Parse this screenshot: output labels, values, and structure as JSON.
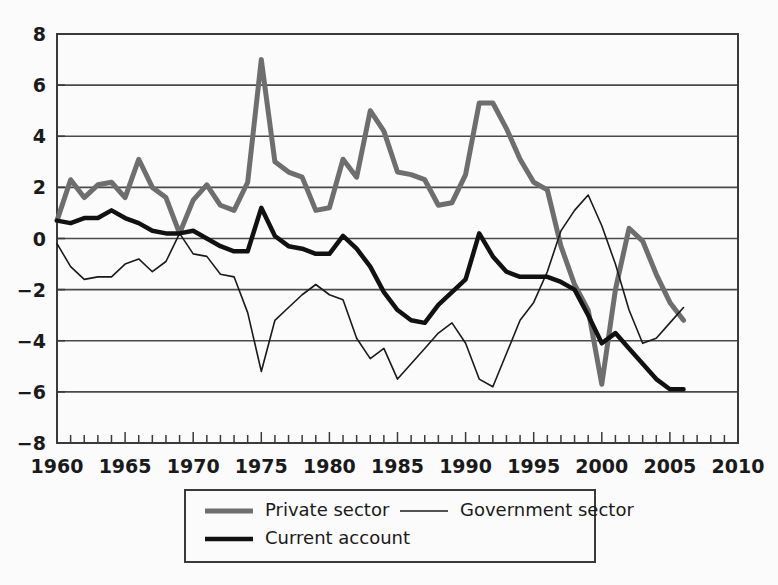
{
  "chart_data": {
    "type": "line",
    "title": "",
    "subtitle": "",
    "xlabel": "",
    "ylabel": "",
    "xlim": [
      1960,
      2010
    ],
    "ylim": [
      -8,
      8
    ],
    "grid": true,
    "grid_axis": "y",
    "legend_position": "bottom",
    "x_tick_labels": [
      "1960",
      "1965",
      "1970",
      "1975",
      "1980",
      "1985",
      "1990",
      "1995",
      "2000",
      "2005",
      "2010"
    ],
    "x_tick_values": [
      1960,
      1965,
      1970,
      1975,
      1980,
      1985,
      1990,
      1995,
      2000,
      2005,
      2010
    ],
    "x_minor_tick_step": 1,
    "y_tick_labels": [
      "8",
      "6",
      "4",
      "2",
      "0",
      "−2",
      "−4",
      "−6",
      "−8"
    ],
    "y_tick_values": [
      8,
      6,
      4,
      2,
      0,
      -2,
      -4,
      -6,
      -8
    ],
    "x": [
      1960,
      1961,
      1962,
      1963,
      1964,
      1965,
      1966,
      1967,
      1968,
      1969,
      1970,
      1971,
      1972,
      1973,
      1974,
      1975,
      1976,
      1977,
      1978,
      1979,
      1980,
      1981,
      1982,
      1983,
      1984,
      1985,
      1986,
      1987,
      1988,
      1989,
      1990,
      1991,
      1992,
      1993,
      1994,
      1995,
      1996,
      1997,
      1998,
      1999,
      2000,
      2001,
      2002,
      2003,
      2004,
      2005,
      2006
    ],
    "series": [
      {
        "name": "Private sector",
        "color": "#6e6e6e",
        "width": 5,
        "values": [
          0.7,
          2.3,
          1.6,
          2.1,
          2.2,
          1.6,
          3.1,
          2.0,
          1.6,
          0.2,
          1.5,
          2.1,
          1.3,
          1.1,
          2.2,
          7.0,
          3.0,
          2.6,
          2.4,
          1.1,
          1.2,
          3.1,
          2.4,
          5.0,
          4.2,
          2.6,
          2.5,
          2.3,
          1.3,
          1.4,
          2.5,
          5.3,
          5.3,
          4.3,
          3.1,
          2.2,
          1.9,
          -0.3,
          -1.8,
          -2.8,
          -5.7,
          -2.0,
          0.4,
          -0.1,
          -1.4,
          -2.5,
          -3.2
        ]
      },
      {
        "name": "Government sector",
        "color": "#1a1a1a",
        "width": 1.6,
        "values": [
          -0.2,
          -1.1,
          -1.6,
          -1.5,
          -1.5,
          -1.0,
          -0.8,
          -1.3,
          -0.9,
          0.2,
          -0.6,
          -0.7,
          -1.4,
          -1.5,
          -2.9,
          -5.2,
          -3.2,
          -2.7,
          -2.2,
          -1.8,
          -2.2,
          -2.4,
          -3.9,
          -4.7,
          -4.3,
          -5.5,
          -4.9,
          -4.3,
          -3.7,
          -3.3,
          -4.1,
          -5.5,
          -5.8,
          -4.5,
          -3.2,
          -2.5,
          -1.3,
          0.3,
          1.1,
          1.7,
          0.5,
          -1.0,
          -2.8,
          -4.1,
          -3.9,
          -3.3,
          -2.7
        ]
      },
      {
        "name": "Current account",
        "color": "#111111",
        "width": 4.5,
        "values": [
          0.7,
          0.6,
          0.8,
          0.8,
          1.1,
          0.8,
          0.6,
          0.3,
          0.2,
          0.2,
          0.3,
          0.0,
          -0.3,
          -0.5,
          -0.5,
          1.2,
          0.1,
          -0.3,
          -0.4,
          -0.6,
          -0.6,
          0.1,
          -0.4,
          -1.1,
          -2.1,
          -2.8,
          -3.2,
          -3.3,
          -2.6,
          -2.1,
          -1.6,
          0.2,
          -0.7,
          -1.3,
          -1.5,
          -1.5,
          -1.5,
          -1.7,
          -2.0,
          -3.0,
          -4.1,
          -3.7,
          -4.3,
          -4.9,
          -5.5,
          -5.9,
          -5.9
        ]
      }
    ]
  },
  "legend": {
    "items": [
      {
        "label": "Private sector",
        "color": "#6e6e6e",
        "width": 5
      },
      {
        "label": "Government sector",
        "color": "#1a1a1a",
        "width": 1.6
      },
      {
        "label": "Current account",
        "color": "#111111",
        "width": 4.5
      }
    ]
  },
  "colors": {
    "background": "#fbfbfb",
    "grid": "#4a4a4a",
    "axis": "#3a3a3a",
    "text": "#1a1a1a"
  }
}
